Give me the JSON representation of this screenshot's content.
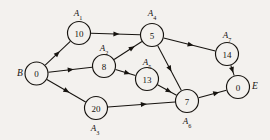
{
  "diagram": {
    "type": "activity-on-node-network",
    "title": "",
    "background_color": "#f3f1ee",
    "ink_color": "#16130f",
    "nodes": [
      {
        "id": "B",
        "value": "0",
        "cx": 36.5,
        "cy": 73.5,
        "r": 11.5,
        "activity_label": null,
        "activity_sub": null,
        "terminal_label": "B",
        "terminal_x": 20,
        "terminal_y": 73
      },
      {
        "id": "A1",
        "value": "10",
        "cx": 79.0,
        "cy": 33.0,
        "r": 11.5,
        "activity_label": "A",
        "activity_sub": "1",
        "label_x": 78,
        "label_y": 13
      },
      {
        "id": "A2",
        "value": "8",
        "cx": 104.0,
        "cy": 66.0,
        "r": 11.5,
        "activity_label": "A",
        "activity_sub": "2",
        "label_x": 104,
        "label_y": 48
      },
      {
        "id": "A3",
        "value": "20",
        "cx": 96.0,
        "cy": 108.0,
        "r": 11.5,
        "activity_label": "A",
        "activity_sub": "3",
        "label_x": 95,
        "label_y": 128
      },
      {
        "id": "A4",
        "value": "5",
        "cx": 152.0,
        "cy": 35.0,
        "r": 11.5,
        "activity_label": "A",
        "activity_sub": "4",
        "label_x": 152,
        "label_y": 13
      },
      {
        "id": "A5",
        "value": "13",
        "cx": 147.0,
        "cy": 79.0,
        "r": 11.5,
        "activity_label": "A",
        "activity_sub": "5",
        "label_x": 147,
        "label_y": 62
      },
      {
        "id": "A6",
        "value": "7",
        "cx": 187.0,
        "cy": 101.0,
        "r": 11.5,
        "activity_label": "A",
        "activity_sub": "6",
        "label_x": 187,
        "label_y": 121
      },
      {
        "id": "A7",
        "value": "14",
        "cx": 227.0,
        "cy": 54.0,
        "r": 11.5,
        "activity_label": "A",
        "activity_sub": "7",
        "label_x": 227,
        "label_y": 35
      },
      {
        "id": "E",
        "value": "0",
        "cx": 238.0,
        "cy": 87.0,
        "r": 11.5,
        "activity_label": null,
        "activity_sub": null,
        "terminal_label": "E",
        "terminal_x": 255,
        "terminal_y": 86
      }
    ],
    "edges": [
      {
        "from": "B",
        "to": "A1"
      },
      {
        "from": "B",
        "to": "A2"
      },
      {
        "from": "B",
        "to": "A3"
      },
      {
        "from": "A1",
        "to": "A4"
      },
      {
        "from": "A2",
        "to": "A4"
      },
      {
        "from": "A2",
        "to": "A5"
      },
      {
        "from": "A4",
        "to": "A7"
      },
      {
        "from": "A4",
        "to": "A6"
      },
      {
        "from": "A5",
        "to": "A6"
      },
      {
        "from": "A3",
        "to": "A6"
      },
      {
        "from": "A6",
        "to": "E"
      },
      {
        "from": "A7",
        "to": "E"
      }
    ]
  }
}
